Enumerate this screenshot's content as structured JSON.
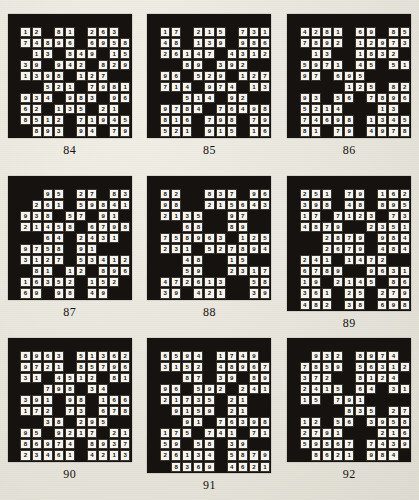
{
  "page": {
    "type": "number-fill-in puzzle book page",
    "grid_columns": 11,
    "grid_rows": 10,
    "colors": {
      "paper": "#e9e6de",
      "block": "#15120f",
      "cell": "#f6f4ee",
      "ink": "#14110d"
    }
  },
  "puzzles": [
    {
      "caption": "84",
      "rows": [
        [
          "#",
          "#",
          "#",
          "#",
          "#",
          "#",
          "#",
          "#",
          "#",
          "#",
          "#"
        ],
        [
          "#",
          "1",
          "2",
          "#",
          "8",
          "1",
          "#",
          "2",
          "6",
          "3",
          "#"
        ],
        [
          "#",
          "7",
          "4",
          "8",
          "9",
          "6",
          "#",
          "6",
          "9",
          "5",
          "8"
        ],
        [
          "#",
          "#",
          "1",
          "3",
          "#",
          "8",
          "4",
          "9",
          "#",
          "1",
          "5"
        ],
        [
          "#",
          "3",
          "9",
          "#",
          "9",
          "4",
          "2",
          "#",
          "8",
          "2",
          "9"
        ],
        [
          "#",
          "1",
          "3",
          "9",
          "8",
          "#",
          "1",
          "2",
          "7",
          "#",
          "#"
        ],
        [
          "#",
          "#",
          "#",
          "5",
          "2",
          "1",
          "#",
          "7",
          "9",
          "8",
          "1"
        ],
        [
          "#",
          "9",
          "3",
          "4",
          "#",
          "9",
          "8",
          "3",
          "#",
          "9",
          "6"
        ],
        [
          "#",
          "6",
          "2",
          "#",
          "1",
          "3",
          "5",
          "#",
          "2",
          "1",
          "#"
        ],
        [
          "#",
          "8",
          "5",
          "1",
          "2",
          "#",
          "7",
          "1",
          "9",
          "4",
          "5"
        ],
        [
          "#",
          "#",
          "8",
          "9",
          "3",
          "#",
          "9",
          "4",
          "#",
          "7",
          "9"
        ]
      ]
    },
    {
      "caption": "85",
      "rows": [
        [
          "#",
          "#",
          "#",
          "#",
          "#",
          "#",
          "#",
          "#",
          "#",
          "#",
          "#"
        ],
        [
          "#",
          "1",
          "7",
          "#",
          "2",
          "1",
          "5",
          "#",
          "7",
          "3",
          "1"
        ],
        [
          "#",
          "4",
          "8",
          "#",
          "1",
          "3",
          "9",
          "#",
          "9",
          "8",
          "6"
        ],
        [
          "#",
          "2",
          "6",
          "1",
          "4",
          "7",
          "#",
          "4",
          "3",
          "1",
          "2"
        ],
        [
          "#",
          "#",
          "#",
          "8",
          "9",
          "#",
          "3",
          "9",
          "2",
          "#",
          "#"
        ],
        [
          "#",
          "9",
          "6",
          "#",
          "5",
          "2",
          "9",
          "#",
          "1",
          "2",
          "7"
        ],
        [
          "#",
          "7",
          "1",
          "4",
          "#",
          "9",
          "7",
          "4",
          "#",
          "1",
          "3"
        ],
        [
          "#",
          "#",
          "#",
          "5",
          "1",
          "4",
          "#",
          "9",
          "2",
          "#",
          "#"
        ],
        [
          "#",
          "9",
          "7",
          "8",
          "4",
          "#",
          "7",
          "6",
          "4",
          "9",
          "8"
        ],
        [
          "#",
          "8",
          "1",
          "6",
          "#",
          "7",
          "9",
          "8",
          "#",
          "7",
          "9"
        ],
        [
          "#",
          "5",
          "2",
          "1",
          "#",
          "9",
          "1",
          "5",
          "#",
          "1",
          "6"
        ]
      ]
    },
    {
      "caption": "86",
      "rows": [
        [
          "#",
          "#",
          "#",
          "#",
          "#",
          "#",
          "#",
          "#",
          "#",
          "#",
          "#"
        ],
        [
          "#",
          "4",
          "2",
          "8",
          "1",
          "#",
          "6",
          "9",
          "#",
          "8",
          "5"
        ],
        [
          "#",
          "7",
          "8",
          "9",
          "2",
          "#",
          "1",
          "2",
          "9",
          "7",
          "3"
        ],
        [
          "#",
          "#",
          "1",
          "3",
          "#",
          "#",
          "1",
          "8",
          "3",
          "2",
          "#"
        ],
        [
          "#",
          "5",
          "9",
          "7",
          "1",
          "#",
          "4",
          "5",
          "#",
          "5",
          "1"
        ],
        [
          "#",
          "9",
          "7",
          "#",
          "6",
          "9",
          "5",
          "#",
          "#",
          "#",
          "#"
        ],
        [
          "#",
          "#",
          "#",
          "#",
          "#",
          "1",
          "2",
          "5",
          "#",
          "8",
          "2"
        ],
        [
          "#",
          "9",
          "3",
          "#",
          "5",
          "6",
          "#",
          "7",
          "8",
          "9",
          "6"
        ],
        [
          "#",
          "5",
          "2",
          "1",
          "4",
          "#",
          "#",
          "#",
          "1",
          "3",
          "#"
        ],
        [
          "#",
          "7",
          "4",
          "6",
          "9",
          "8",
          "#",
          "1",
          "3",
          "4",
          "5"
        ],
        [
          "#",
          "8",
          "1",
          "#",
          "7",
          "9",
          "#",
          "4",
          "9",
          "7",
          "8"
        ]
      ]
    },
    {
      "caption": "87",
      "rows": [
        [
          "#",
          "#",
          "#",
          "#",
          "#",
          "#",
          "#",
          "#",
          "#",
          "#",
          "#"
        ],
        [
          "#",
          "#",
          "#",
          "9",
          "5",
          "#",
          "2",
          "7",
          "#",
          "8",
          "3"
        ],
        [
          "#",
          "#",
          "2",
          "6",
          "1",
          "#",
          "5",
          "9",
          "8",
          "4",
          "1"
        ],
        [
          "#",
          "9",
          "3",
          "8",
          "#",
          "5",
          "7",
          "#",
          "9",
          "1",
          "#"
        ],
        [
          "#",
          "2",
          "1",
          "4",
          "5",
          "8",
          "#",
          "6",
          "7",
          "9",
          "8"
        ],
        [
          "#",
          "#",
          "#",
          "6",
          "4",
          "#",
          "2",
          "4",
          "3",
          "1",
          "#"
        ],
        [
          "#",
          "9",
          "7",
          "5",
          "8",
          "#",
          "9",
          "1",
          "#",
          "#",
          "#"
        ],
        [
          "#",
          "3",
          "1",
          "2",
          "7",
          "#",
          "5",
          "3",
          "4",
          "1",
          "2"
        ],
        [
          "#",
          "#",
          "8",
          "1",
          "#",
          "1",
          "2",
          "#",
          "8",
          "9",
          "6"
        ],
        [
          "#",
          "1",
          "6",
          "3",
          "5",
          "2",
          "#",
          "1",
          "5",
          "2",
          "#"
        ],
        [
          "#",
          "6",
          "9",
          "#",
          "9",
          "8",
          "#",
          "4",
          "9",
          "#",
          "#"
        ]
      ]
    },
    {
      "caption": "88",
      "rows": [
        [
          "#",
          "#",
          "#",
          "#",
          "#",
          "#",
          "#",
          "#",
          "#",
          "#",
          "#"
        ],
        [
          "#",
          "8",
          "2",
          "#",
          "#",
          "8",
          "3",
          "7",
          "#",
          "9",
          "6"
        ],
        [
          "#",
          "9",
          "8",
          "#",
          "#",
          "2",
          "1",
          "5",
          "6",
          "4",
          "3"
        ],
        [
          "#",
          "2",
          "1",
          "3",
          "5",
          "#",
          "#",
          "9",
          "7",
          "#",
          "#"
        ],
        [
          "#",
          "#",
          "#",
          "6",
          "8",
          "#",
          "#",
          "8",
          "9",
          "#",
          "#"
        ],
        [
          "#",
          "7",
          "5",
          "8",
          "9",
          "6",
          "3",
          "#",
          "1",
          "2",
          "5"
        ],
        [
          "#",
          "2",
          "3",
          "1",
          "#",
          "5",
          "2",
          "7",
          "8",
          "9",
          "4"
        ],
        [
          "#",
          "#",
          "#",
          "4",
          "8",
          "#",
          "#",
          "1",
          "5",
          "#",
          "#"
        ],
        [
          "#",
          "#",
          "#",
          "5",
          "9",
          "#",
          "#",
          "2",
          "3",
          "1",
          "7"
        ],
        [
          "#",
          "4",
          "7",
          "2",
          "6",
          "1",
          "3",
          "#",
          "#",
          "5",
          "8"
        ],
        [
          "#",
          "3",
          "9",
          "#",
          "4",
          "2",
          "1",
          "#",
          "#",
          "3",
          "9"
        ]
      ]
    },
    {
      "caption": "89",
      "rows": [
        [
          "#",
          "#",
          "#",
          "#",
          "#",
          "#",
          "#",
          "#",
          "#",
          "#",
          "#"
        ],
        [
          "#",
          "2",
          "5",
          "1",
          "#",
          "7",
          "9",
          "#",
          "1",
          "6",
          "2"
        ],
        [
          "#",
          "3",
          "9",
          "8",
          "#",
          "4",
          "8",
          "#",
          "8",
          "9",
          "5"
        ],
        [
          "#",
          "1",
          "7",
          "#",
          "7",
          "1",
          "2",
          "3",
          "#",
          "7",
          "3"
        ],
        [
          "#",
          "4",
          "8",
          "7",
          "9",
          "#",
          "#",
          "2",
          "3",
          "5",
          "1"
        ],
        [
          "#",
          "#",
          "#",
          "2",
          "8",
          "7",
          "9",
          "#",
          "9",
          "8",
          "4"
        ],
        [
          "#",
          "#",
          "#",
          "2",
          "6",
          "7",
          "9",
          "#",
          "4",
          "8",
          "4"
        ],
        [
          "#",
          "2",
          "4",
          "1",
          "#",
          "1",
          "4",
          "7",
          "2",
          "#",
          "#"
        ],
        [
          "#",
          "6",
          "7",
          "8",
          "9",
          "#",
          "#",
          "9",
          "6",
          "3",
          "1"
        ],
        [
          "#",
          "1",
          "9",
          "#",
          "2",
          "1",
          "4",
          "5",
          "#",
          "8",
          "6"
        ],
        [
          "#",
          "3",
          "6",
          "1",
          "#",
          "2",
          "5",
          "#",
          "2",
          "7",
          "9"
        ],
        [
          "#",
          "4",
          "8",
          "2",
          "#",
          "3",
          "8",
          "#",
          "6",
          "9",
          "8"
        ]
      ]
    },
    {
      "caption": "90",
      "rows": [
        [
          "#",
          "#",
          "#",
          "#",
          "#",
          "#",
          "#",
          "#",
          "#",
          "#",
          "#"
        ],
        [
          "#",
          "8",
          "9",
          "6",
          "3",
          "#",
          "5",
          "1",
          "3",
          "6",
          "2"
        ],
        [
          "#",
          "9",
          "7",
          "2",
          "1",
          "#",
          "8",
          "5",
          "7",
          "9",
          "6"
        ],
        [
          "#",
          "3",
          "1",
          "#",
          "4",
          "5",
          "1",
          "2",
          "#",
          "8",
          "1"
        ],
        [
          "#",
          "#",
          "#",
          "7",
          "9",
          "8",
          "#",
          "3",
          "4",
          "#",
          "#"
        ],
        [
          "#",
          "3",
          "9",
          "1",
          "#",
          "9",
          "8",
          "#",
          "1",
          "6",
          "6"
        ],
        [
          "#",
          "1",
          "7",
          "2",
          "#",
          "7",
          "3",
          "#",
          "6",
          "7",
          "8"
        ],
        [
          "#",
          "#",
          "#",
          "3",
          "8",
          "#",
          "2",
          "9",
          "5",
          "#",
          "#"
        ],
        [
          "#",
          "9",
          "5",
          "#",
          "9",
          "2",
          "1",
          "7",
          "#",
          "2",
          "1"
        ],
        [
          "#",
          "8",
          "6",
          "9",
          "7",
          "4",
          "#",
          "8",
          "9",
          "3",
          "7"
        ],
        [
          "#",
          "2",
          "3",
          "4",
          "6",
          "1",
          "#",
          "4",
          "2",
          "1",
          "3"
        ]
      ]
    },
    {
      "caption": "91",
      "rows": [
        [
          "#",
          "#",
          "#",
          "#",
          "#",
          "#",
          "#",
          "#",
          "#",
          "#",
          "#"
        ],
        [
          "#",
          "6",
          "5",
          "9",
          "4",
          "#",
          "1",
          "7",
          "4",
          "9",
          "#"
        ],
        [
          "#",
          "3",
          "1",
          "5",
          "2",
          "#",
          "4",
          "8",
          "9",
          "6",
          "7"
        ],
        [
          "#",
          "#",
          "#",
          "8",
          "7",
          "#",
          "3",
          "9",
          "#",
          "8",
          "9"
        ],
        [
          "#",
          "9",
          "6",
          "#",
          "5",
          "9",
          "2",
          "#",
          "2",
          "4",
          "1"
        ],
        [
          "#",
          "2",
          "1",
          "7",
          "3",
          "5",
          "#",
          "2",
          "1",
          "#",
          "#"
        ],
        [
          "#",
          "#",
          "9",
          "1",
          "5",
          "9",
          "#",
          "2",
          "1",
          "#",
          "#"
        ],
        [
          "#",
          "#",
          "#",
          "9",
          "1",
          "#",
          "7",
          "6",
          "3",
          "9",
          "8"
        ],
        [
          "#",
          "1",
          "7",
          "5",
          "#",
          "7",
          "4",
          "1",
          "#",
          "7",
          "1"
        ],
        [
          "#",
          "5",
          "9",
          "#",
          "5",
          "8",
          "#",
          "3",
          "9",
          "#",
          "#"
        ],
        [
          "#",
          "2",
          "6",
          "1",
          "3",
          "4",
          "#",
          "5",
          "8",
          "7",
          "9"
        ],
        [
          "#",
          "#",
          "8",
          "3",
          "6",
          "9",
          "#",
          "4",
          "6",
          "2",
          "1"
        ]
      ]
    },
    {
      "caption": "92",
      "rows": [
        [
          "#",
          "#",
          "#",
          "#",
          "#",
          "#",
          "#",
          "#",
          "#",
          "#",
          "#"
        ],
        [
          "#",
          "#",
          "9",
          "3",
          "2",
          "#",
          "8",
          "9",
          "7",
          "4",
          "#"
        ],
        [
          "#",
          "7",
          "8",
          "5",
          "9",
          "#",
          "5",
          "6",
          "3",
          "1",
          "2"
        ],
        [
          "#",
          "3",
          "7",
          "2",
          "#",
          "#",
          "8",
          "1",
          "2",
          "4",
          "#"
        ],
        [
          "#",
          "2",
          "4",
          "1",
          "5",
          "#",
          "6",
          "4",
          "#",
          "3",
          "1"
        ],
        [
          "#",
          "1",
          "5",
          "#",
          "7",
          "9",
          "1",
          "#",
          "#",
          "#",
          "#"
        ],
        [
          "#",
          "#",
          "#",
          "#",
          "#",
          "8",
          "3",
          "5",
          "#",
          "2",
          "7"
        ],
        [
          "#",
          "1",
          "2",
          "#",
          "5",
          "6",
          "#",
          "3",
          "9",
          "5",
          "8"
        ],
        [
          "#",
          "2",
          "7",
          "9",
          "1",
          "#",
          "#",
          "#",
          "2",
          "1",
          "6"
        ],
        [
          "#",
          "5",
          "9",
          "8",
          "6",
          "7",
          "#",
          "7",
          "4",
          "3",
          "9"
        ],
        [
          "#",
          "#",
          "8",
          "6",
          "2",
          "1",
          "#",
          "9",
          "8",
          "4",
          "#"
        ]
      ]
    }
  ]
}
